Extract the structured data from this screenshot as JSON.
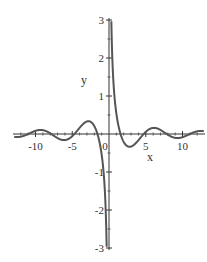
{
  "chart_data": {
    "type": "line",
    "title": "",
    "xlabel": "x",
    "ylabel": "y",
    "function": "cos(x)/x",
    "xlim": [
      -12.9,
      12.9
    ],
    "ylim": [
      -3,
      3
    ],
    "grid": false,
    "legend": null,
    "x_ticks": [
      -10,
      -5,
      0,
      5,
      10
    ],
    "x_tick_labels": [
      "-10",
      "-5",
      "0",
      "5",
      "10"
    ],
    "y_ticks": [
      -3,
      -2,
      -1,
      1,
      2,
      3
    ],
    "y_tick_labels": [
      "-3",
      "-2",
      "-1",
      "1",
      "2",
      "3"
    ],
    "series": [
      {
        "name": "cos(x)/x",
        "color": "#555555",
        "x": [
          -12.9,
          -12,
          -11,
          -10,
          -9.5,
          -9,
          -8,
          -7,
          -6.4,
          -6,
          -5,
          -4.7,
          -4,
          -3.4,
          -3,
          -2,
          -1.57,
          -1,
          -0.5,
          -0.33,
          0.33,
          0.5,
          1,
          1.57,
          2,
          3,
          3.4,
          4,
          4.7,
          5,
          6,
          6.4,
          7,
          8,
          9,
          9.5,
          10,
          11,
          12,
          12.9
        ],
        "values": [
          -0.074,
          -0.07,
          -0.0004,
          0.084,
          0.105,
          0.101,
          0.018,
          -0.108,
          -0.155,
          -0.16,
          -0.057,
          0.0,
          0.163,
          0.284,
          0.33,
          0.208,
          0.0,
          -0.54,
          -1.755,
          -2.85,
          2.85,
          1.755,
          0.54,
          0.0,
          -0.208,
          -0.33,
          -0.284,
          -0.163,
          0.0,
          0.057,
          0.16,
          0.155,
          0.108,
          -0.018,
          -0.101,
          -0.105,
          -0.084,
          0.0004,
          0.07,
          0.074
        ]
      }
    ]
  }
}
